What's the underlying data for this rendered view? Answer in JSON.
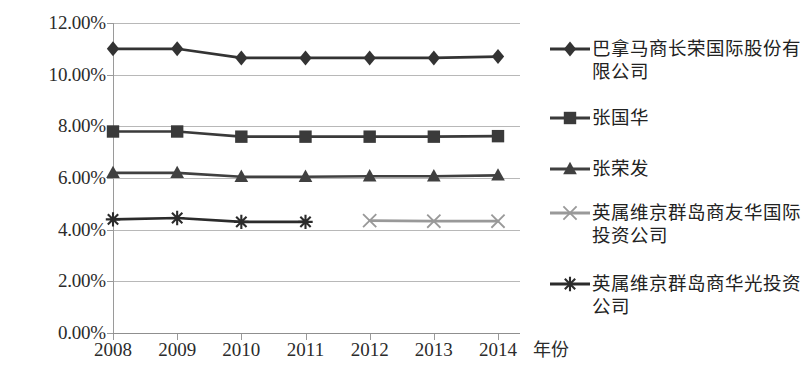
{
  "chart_data": {
    "type": "line",
    "title": "",
    "subtitle": "",
    "xlabel": "年份",
    "ylabel": "",
    "categories": [
      "2008",
      "2009",
      "2010",
      "2011",
      "2012",
      "2013",
      "2014"
    ],
    "ylim": [
      0,
      12
    ],
    "y_tick_labels": [
      "0.00%",
      "2.00%",
      "4.00%",
      "6.00%",
      "8.00%",
      "10.00%",
      "12.00%"
    ],
    "y_tick_values": [
      0,
      2,
      4,
      6,
      8,
      10,
      12
    ],
    "grid": true,
    "legend_position": "right",
    "value_unit": "%",
    "series": [
      {
        "name": "巴拿马商长荣国际股份有限公司",
        "marker": "diamond",
        "color": "#333333",
        "values": [
          11.0,
          11.0,
          10.65,
          10.65,
          10.65,
          10.65,
          10.7
        ]
      },
      {
        "name": "张国华",
        "marker": "square",
        "color": "#3a3a3a",
        "values": [
          7.8,
          7.8,
          7.6,
          7.6,
          7.6,
          7.6,
          7.62
        ]
      },
      {
        "name": "张荣发",
        "marker": "triangle",
        "color": "#404040",
        "values": [
          6.2,
          6.2,
          6.05,
          6.05,
          6.07,
          6.07,
          6.1
        ]
      },
      {
        "name": "英属维京群岛商友华国际投资公司",
        "marker": "x",
        "color": "#999999",
        "values": [
          null,
          null,
          null,
          null,
          4.35,
          4.33,
          4.33
        ]
      },
      {
        "name": "英属维京群岛商华光投资公司",
        "marker": "asterisk",
        "color": "#2b2b2b",
        "values": [
          4.4,
          4.45,
          4.3,
          4.3,
          null,
          null,
          null
        ]
      }
    ]
  },
  "axes": {
    "x_title": "年份"
  },
  "legend": {
    "items": [
      {
        "label": "巴拿马商长荣国际股份有限公司",
        "marker": "diamond-marker-icon",
        "color": "#333333"
      },
      {
        "label": "张国华",
        "marker": "square-marker-icon",
        "color": "#3a3a3a"
      },
      {
        "label": "张荣发",
        "marker": "triangle-marker-icon",
        "color": "#404040"
      },
      {
        "label": "英属维京群岛商友华国际投资公司",
        "marker": "x-marker-icon",
        "color": "#999999"
      },
      {
        "label": "英属维京群岛商华光投资公司",
        "marker": "asterisk-marker-icon",
        "color": "#2b2b2b"
      }
    ]
  }
}
